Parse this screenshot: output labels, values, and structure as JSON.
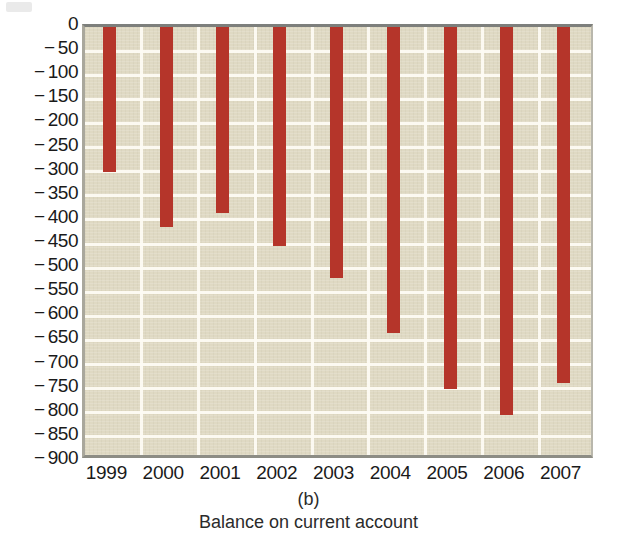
{
  "panel": {
    "label": "(b)",
    "caption": "Balance on current account"
  },
  "colors": {
    "bar": "#b5352a",
    "plot_background": "#dfd9c3",
    "gridline": "#fdfbf3",
    "text": "#1a1a1a"
  },
  "chart_data": {
    "type": "bar",
    "title": "Balance on current account",
    "subtitle": "(b)",
    "xlabel": "",
    "ylabel": "",
    "categories": [
      "1999",
      "2000",
      "2001",
      "2002",
      "2003",
      "2004",
      "2005",
      "2006",
      "2007"
    ],
    "values": [
      -300,
      -415,
      -385,
      -455,
      -520,
      -635,
      -750,
      -805,
      -738
    ],
    "ylim": [
      -900,
      0
    ],
    "ytick_values": [
      0,
      -50,
      -100,
      -150,
      -200,
      -250,
      -300,
      -350,
      -400,
      -450,
      -500,
      -550,
      -600,
      -650,
      -700,
      -750,
      -800,
      -850,
      -900
    ],
    "ytick_labels": [
      "0",
      "− 50",
      "− 100",
      "− 150",
      "− 200",
      "− 250",
      "− 300",
      "− 350",
      "− 400",
      "− 450",
      "− 500",
      "− 550",
      "− 600",
      "− 650",
      "− 700",
      "− 750",
      "− 800",
      "− 850",
      "− 900"
    ],
    "grid": true,
    "vertical_grid": true,
    "legend": null,
    "legend_position": "none"
  }
}
